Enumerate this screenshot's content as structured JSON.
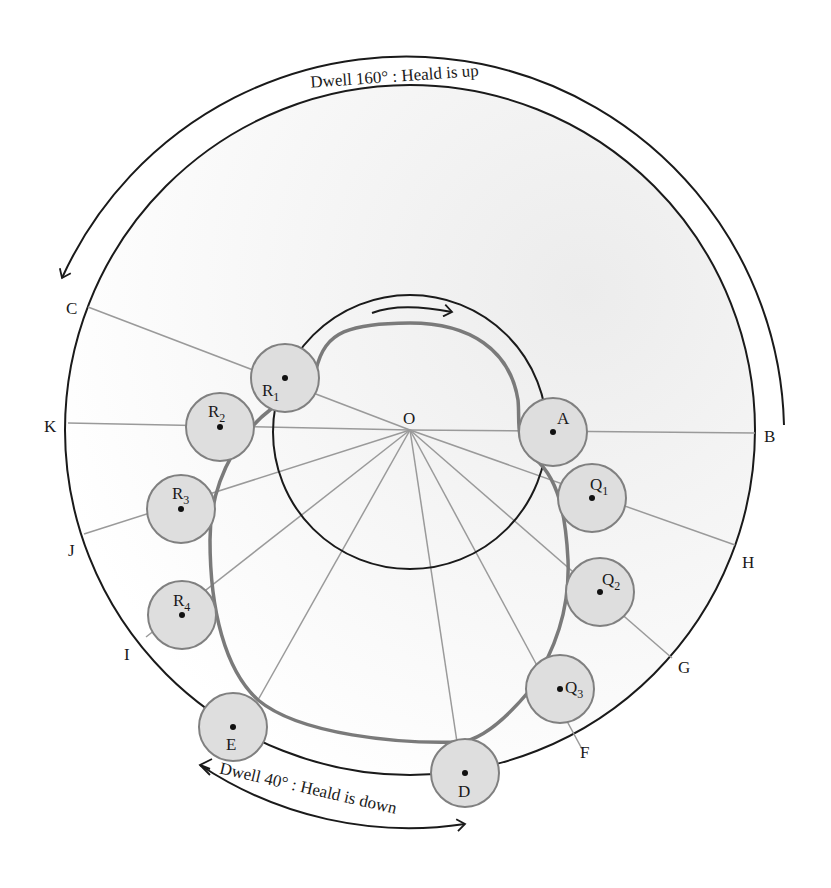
{
  "figure": {
    "center_label": "O",
    "rotation_direction": "clockwise",
    "dwell_top": {
      "text": "Dwell 160° : Heald is up",
      "angle_deg": 160,
      "state": "Heald is up"
    },
    "dwell_bottom": {
      "text": "Dwell 40° : Heald is down",
      "angle_deg": 40,
      "state": "Heald is down"
    },
    "outer_points": [
      {
        "id": "C",
        "label": "C"
      },
      {
        "id": "K",
        "label": "K"
      },
      {
        "id": "J",
        "label": "J"
      },
      {
        "id": "I",
        "label": "I"
      },
      {
        "id": "B",
        "label": "B"
      },
      {
        "id": "H",
        "label": "H"
      },
      {
        "id": "G",
        "label": "G"
      },
      {
        "id": "F",
        "label": "F"
      }
    ],
    "rollers": [
      {
        "id": "R1",
        "base": "R",
        "sub": "1"
      },
      {
        "id": "R2",
        "base": "R",
        "sub": "2"
      },
      {
        "id": "R3",
        "base": "R",
        "sub": "3"
      },
      {
        "id": "R4",
        "base": "R",
        "sub": "4"
      },
      {
        "id": "E",
        "base": "E",
        "sub": ""
      },
      {
        "id": "D",
        "base": "D",
        "sub": ""
      },
      {
        "id": "Q3",
        "base": "Q",
        "sub": "3"
      },
      {
        "id": "Q2",
        "base": "Q",
        "sub": "2"
      },
      {
        "id": "Q1",
        "base": "Q",
        "sub": "1"
      },
      {
        "id": "A",
        "base": "A",
        "sub": ""
      }
    ],
    "colors": {
      "ink": "#1a1a1a",
      "cam_profile": "#7a7a7a",
      "radial_lines": "#9a9a9a",
      "roller_fill": "#dedede",
      "roller_stroke": "#808080",
      "shade": "#f0f0f0"
    }
  }
}
